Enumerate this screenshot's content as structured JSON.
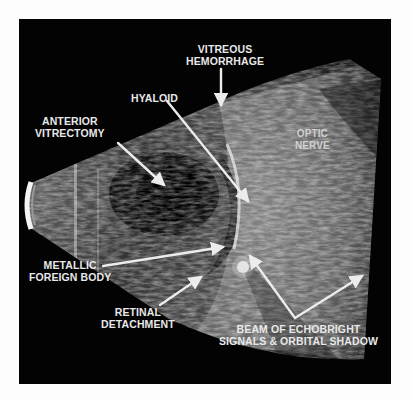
{
  "figure": {
    "type": "B-scan ocular ultrasound",
    "background_color": "#030303",
    "label_color": "#e8e8e8",
    "labels": {
      "vitreous_hemorrhage": [
        "VITREOUS",
        "HEMORRHAGE"
      ],
      "hyaloid": [
        "HYALOID"
      ],
      "anterior_vitrectomy": [
        "ANTERIOR",
        "VITRECTOMY"
      ],
      "optic_nerve": [
        "OPTIC",
        "NERVE"
      ],
      "metallic_foreign_body": [
        "METALLIC",
        "FOREIGN BODY"
      ],
      "retinal_detachment": [
        "RETINAL",
        "DETACHMENT"
      ],
      "beam": [
        "BEAM OF ECHOBRIGHT",
        "SIGNALS & ORBITAL SHADOW"
      ]
    }
  }
}
